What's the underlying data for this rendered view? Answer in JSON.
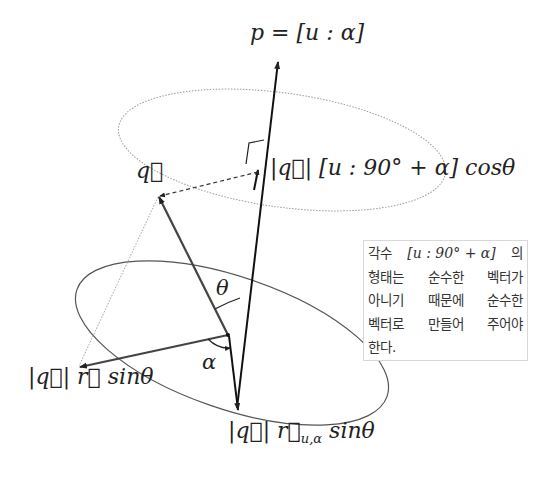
{
  "diagram": {
    "labels": {
      "p_axis": "p = [u : α]",
      "q_vector": "q⃗",
      "projection": "|q⃗| [u : 90° + α] cosθ",
      "theta": "θ",
      "alpha": "α",
      "left_component": "|q⃗| r⃗ sinθ",
      "bottom_component_main": "|q⃗| r⃗",
      "bottom_component_sub": "u,α",
      "bottom_component_tail": " sinθ"
    },
    "note": {
      "lines": [
        [
          "각수",
          "[u : 90° + α]",
          "의"
        ],
        [
          "형태는",
          "순수한",
          "벡터가"
        ],
        [
          "아니기",
          "때문에",
          "순수한"
        ],
        [
          "벡터로",
          "만들어",
          "주어야"
        ],
        [
          "한다."
        ]
      ]
    },
    "colors": {
      "stroke": "#222222",
      "vector_q": "#444444",
      "ellipse_upper": "#999999",
      "ellipse_lower": "#555555",
      "note_border": "#d8d8d8"
    }
  }
}
